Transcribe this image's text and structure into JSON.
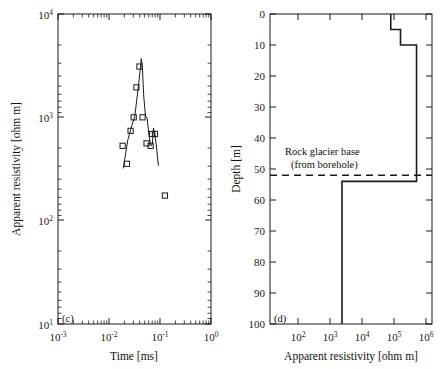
{
  "figure": {
    "background": "#ffffff",
    "line_color": "#1a1a1a",
    "marker_color": "#1a1a1a"
  },
  "chart_data": [
    {
      "type": "scatter",
      "panel_label": "(c)",
      "title": "",
      "xlabel": "Time [ms]",
      "ylabel": "Apparent resistivity [ohm m]",
      "xscale": "log",
      "yscale": "log",
      "xlim": [
        0.001,
        1
      ],
      "ylim": [
        10,
        10000
      ],
      "xticks": [
        0.001,
        0.01,
        0.1,
        1
      ],
      "xtick_labels": [
        "10-3",
        "10-2",
        "10-1",
        "100"
      ],
      "yticks": [
        10,
        100,
        1000,
        10000
      ],
      "ytick_labels": [
        "101",
        "102",
        "103",
        "104"
      ],
      "grid": false,
      "legend": "none",
      "series": [
        {
          "name": "measured",
          "marker": "square-open",
          "x": [
            0.0185,
            0.0225,
            0.0265,
            0.0305,
            0.0345,
            0.0395,
            0.0455,
            0.0545,
            0.0655,
            0.07,
            0.0795,
            0.125
          ],
          "y": [
            530,
            355,
            740,
            1000,
            1950,
            3100,
            1000,
            560,
            530,
            690,
            690,
            175
          ]
        },
        {
          "name": "model-fit",
          "marker": "none",
          "x": [
            0.019,
            0.0235,
            0.028,
            0.032,
            0.036,
            0.04,
            0.043,
            0.045,
            0.048,
            0.052,
            0.056,
            0.06,
            0.065,
            0.068,
            0.071,
            0.0745,
            0.079,
            0.085,
            0.093
          ],
          "y": [
            320,
            610,
            830,
            1020,
            1650,
            2600,
            3700,
            3150,
            1600,
            1020,
            980,
            700,
            540,
            530,
            560,
            790,
            690,
            530,
            340
          ]
        }
      ]
    },
    {
      "type": "line",
      "panel_label": "(d)",
      "title": "",
      "xlabel": "Apparent resistivity [ohm m]",
      "ylabel": "Depth [m]",
      "xscale": "log",
      "yscale": "linear",
      "xlim": [
        30,
        3000000
      ],
      "ylim": [
        0,
        100
      ],
      "y_inverted": true,
      "xticks": [
        100,
        1000,
        10000,
        100000,
        1000000
      ],
      "xtick_labels": [
        "102",
        "103",
        "104",
        "105",
        "106"
      ],
      "yticks": [
        0,
        10,
        20,
        30,
        40,
        50,
        60,
        70,
        80,
        90,
        100
      ],
      "ytick_labels": [
        "0",
        "10",
        "20",
        "30",
        "40",
        "50",
        "60",
        "70",
        "80",
        "90",
        "100"
      ],
      "grid": false,
      "legend": "none",
      "layers": [
        {
          "depth_top": 0,
          "depth_bottom": 5,
          "resistivity": 160000
        },
        {
          "depth_top": 5,
          "depth_bottom": 10,
          "resistivity": 320000
        },
        {
          "depth_top": 10,
          "depth_bottom": 54,
          "resistivity": 1000000
        },
        {
          "depth_top": 54,
          "depth_bottom": 100,
          "resistivity": 5000
        }
      ],
      "annotations": [
        {
          "name": "rock-glacier-base",
          "line1": "Rock glacier base",
          "line2": "(from borehole)",
          "depth": 52,
          "style": "dashed"
        }
      ]
    }
  ]
}
